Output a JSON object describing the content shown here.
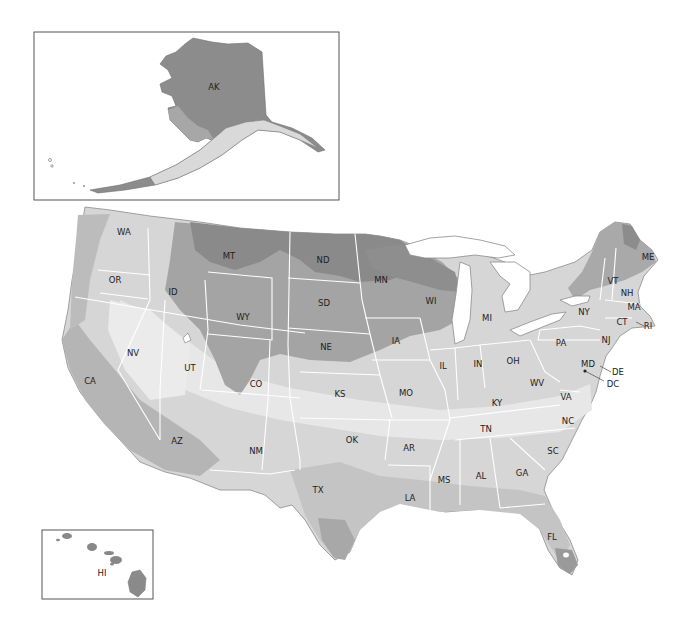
{
  "map": {
    "type": "US states shaded region map (grayscale zones)",
    "colors": {
      "darkest": "#7e7e7e",
      "dark": "#999999",
      "medium": "#b4b4b4",
      "light": "#cdcdcd",
      "lightest": "#e4e4e4",
      "water": "#ffffff",
      "border": "#ffffff"
    },
    "insets": {
      "alaska": {
        "label": "AK"
      },
      "hawaii": {
        "label": "HI"
      }
    },
    "states": [
      {
        "code": "WA",
        "x": 124,
        "y": 232
      },
      {
        "code": "OR",
        "x": 115,
        "y": 280
      },
      {
        "code": "CA",
        "x": 90,
        "y": 381
      },
      {
        "code": "NV",
        "x": 133,
        "y": 353
      },
      {
        "code": "ID",
        "x": 173,
        "y": 292
      },
      {
        "code": "MT",
        "x": 229,
        "y": 256
      },
      {
        "code": "WY",
        "x": 243,
        "y": 317
      },
      {
        "code": "UT",
        "x": 190,
        "y": 368
      },
      {
        "code": "CO",
        "x": 256,
        "y": 384
      },
      {
        "code": "AZ",
        "x": 177,
        "y": 441
      },
      {
        "code": "NM",
        "x": 256,
        "y": 451
      },
      {
        "code": "ND",
        "x": 323,
        "y": 260
      },
      {
        "code": "SD",
        "x": 324,
        "y": 303
      },
      {
        "code": "NE",
        "x": 326,
        "y": 347
      },
      {
        "code": "KS",
        "x": 340,
        "y": 394
      },
      {
        "code": "OK",
        "x": 352,
        "y": 440
      },
      {
        "code": "TX",
        "x": 318,
        "y": 490
      },
      {
        "code": "MN",
        "x": 381,
        "y": 280
      },
      {
        "code": "IA",
        "x": 396,
        "y": 341
      },
      {
        "code": "MO",
        "x": 406,
        "y": 393
      },
      {
        "code": "AR",
        "x": 409,
        "y": 448
      },
      {
        "code": "LA",
        "x": 410,
        "y": 498
      },
      {
        "code": "WI",
        "x": 431,
        "y": 301
      },
      {
        "code": "IL",
        "x": 443,
        "y": 366
      },
      {
        "code": "MI",
        "x": 487,
        "y": 318
      },
      {
        "code": "IN",
        "x": 478,
        "y": 364
      },
      {
        "code": "OH",
        "x": 513,
        "y": 361
      },
      {
        "code": "KY",
        "x": 497,
        "y": 403
      },
      {
        "code": "TN",
        "x": 486,
        "y": 429
      },
      {
        "code": "MS",
        "x": 444,
        "y": 480
      },
      {
        "code": "AL",
        "x": 481,
        "y": 476
      },
      {
        "code": "GA",
        "x": 522,
        "y": 473
      },
      {
        "code": "FL",
        "x": 552,
        "y": 537
      },
      {
        "code": "SC",
        "x": 553,
        "y": 451
      },
      {
        "code": "NC",
        "x": 568,
        "y": 421
      },
      {
        "code": "VA",
        "x": 566,
        "y": 397
      },
      {
        "code": "WV",
        "x": 537,
        "y": 383
      },
      {
        "code": "PA",
        "x": 561,
        "y": 343
      },
      {
        "code": "NY",
        "x": 584,
        "y": 312
      },
      {
        "code": "VT",
        "x": 613,
        "y": 281
      },
      {
        "code": "NH",
        "x": 627,
        "y": 293
      },
      {
        "code": "ME",
        "x": 648,
        "y": 257
      },
      {
        "code": "MA",
        "x": 634,
        "y": 307
      },
      {
        "code": "CT",
        "x": 622,
        "y": 322
      },
      {
        "code": "RI",
        "x": 648,
        "y": 326
      },
      {
        "code": "NJ",
        "x": 606,
        "y": 340
      },
      {
        "code": "MD",
        "x": 588,
        "y": 364
      },
      {
        "code": "DE",
        "x": 618,
        "y": 372
      },
      {
        "code": "DC",
        "x": 613,
        "y": 384
      }
    ]
  }
}
